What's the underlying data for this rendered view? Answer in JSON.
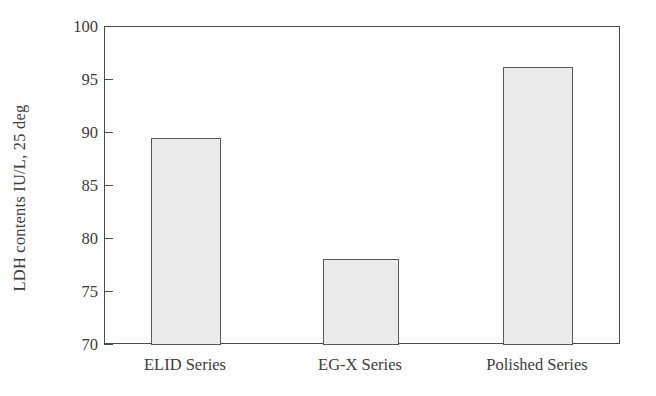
{
  "chart_data": {
    "type": "bar",
    "title": "",
    "subtitle": "",
    "xlabel": "",
    "ylabel": "LDH contents IU/L, 25 deg",
    "categories": [
      "ELID Series",
      "EG-X Series",
      "Polished Series"
    ],
    "values": [
      89.5,
      78.1,
      96.2
    ],
    "ylim": [
      70,
      100
    ],
    "ytick_step": 5,
    "ytick_labels": [
      "100",
      "95",
      "90",
      "85",
      "80",
      "75",
      "70"
    ],
    "ytick_values": [
      100,
      95,
      90,
      85,
      80,
      75,
      70
    ],
    "grid": false,
    "legend": false,
    "legend_position": "none",
    "annotations": [],
    "series": [
      {
        "name": "LDH contents",
        "values": [
          89.5,
          78.1,
          96.2
        ]
      }
    ]
  },
  "style": {
    "bar_fill": "#ebebeb",
    "bar_edge": "#565656",
    "axis_color": "#4a4a4a",
    "text_color": "#3c3c3c",
    "background": "#ffffff"
  }
}
